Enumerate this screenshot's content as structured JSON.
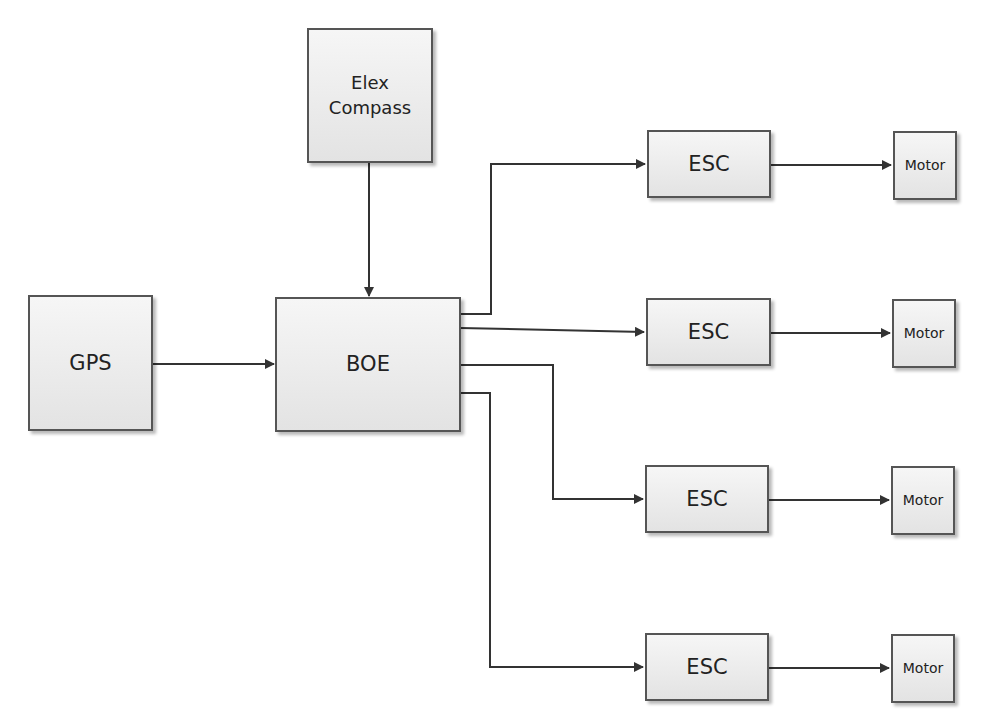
{
  "diagram": {
    "type": "block-diagram",
    "blocks": {
      "compass": {
        "line1": "Elex",
        "line2": "Compass"
      },
      "gps": {
        "label": "GPS"
      },
      "boe": {
        "label": "BOE"
      },
      "esc": [
        {
          "label": "ESC"
        },
        {
          "label": "ESC"
        },
        {
          "label": "ESC"
        },
        {
          "label": "ESC"
        }
      ],
      "motor": [
        {
          "label": "Motor"
        },
        {
          "label": "Motor"
        },
        {
          "label": "Motor"
        },
        {
          "label": "Motor"
        }
      ]
    },
    "connections": [
      {
        "from": "Elex Compass",
        "to": "BOE"
      },
      {
        "from": "GPS",
        "to": "BOE"
      },
      {
        "from": "BOE",
        "to": "ESC 1"
      },
      {
        "from": "BOE",
        "to": "ESC 2"
      },
      {
        "from": "BOE",
        "to": "ESC 3"
      },
      {
        "from": "BOE",
        "to": "ESC 4"
      },
      {
        "from": "ESC 1",
        "to": "Motor 1"
      },
      {
        "from": "ESC 2",
        "to": "Motor 2"
      },
      {
        "from": "ESC 3",
        "to": "Motor 3"
      },
      {
        "from": "ESC 4",
        "to": "Motor 4"
      }
    ],
    "colors": {
      "line": "#333333",
      "block_border": "#555555",
      "block_fill_top": "#f6f6f6",
      "block_fill_bottom": "#e3e3e3",
      "text": "#222222"
    }
  }
}
